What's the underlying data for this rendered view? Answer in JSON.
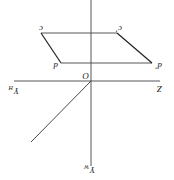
{
  "diagram": {
    "rotation_deg": 180,
    "stroke_color": "#333333",
    "background": "#ffffff",
    "labels": {
      "origin": "O",
      "z_axis": "Z",
      "y_h": {
        "main": "Y",
        "sub": "H"
      },
      "y_w": {
        "main": "Y",
        "sub": "W"
      },
      "point_c": "c",
      "point_c_prime": "c'",
      "point_d": "d",
      "point_d_prime": "d'"
    },
    "points": {
      "O": [
        91,
        81
      ],
      "c": [
        41,
        33
      ],
      "c_prime": [
        117,
        33
      ],
      "d": [
        61,
        63
      ],
      "d_prime": [
        152,
        63
      ]
    }
  }
}
